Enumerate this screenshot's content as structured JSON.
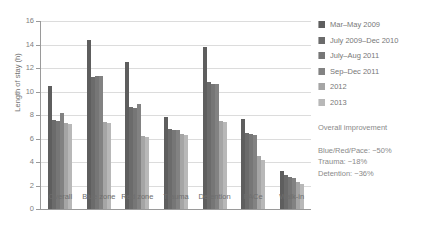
{
  "chart_data": {
    "type": "bar",
    "title": "",
    "xlabel": "",
    "ylabel": "Length of stay (h)",
    "ylim": [
      0,
      16
    ],
    "yticks": [
      0,
      2,
      4,
      6,
      8,
      10,
      12,
      14,
      16
    ],
    "grid": true,
    "legend_position": "right",
    "categories": [
      "Overall",
      "Blue zone",
      "Red zone",
      "Trauma",
      "Detention",
      "PACe",
      "Walk-in"
    ],
    "series": [
      {
        "name": "Mar–May 2009",
        "color": "#5e5e5e",
        "values": [
          10.5,
          14.4,
          12.5,
          7.8,
          13.8,
          7.7,
          3.2
        ]
      },
      {
        "name": "July  2009–Dec 2010",
        "color": "#6b6b6b",
        "values": [
          7.6,
          11.2,
          8.7,
          6.8,
          10.8,
          6.5,
          2.9
        ]
      },
      {
        "name": "July–Aug 2011",
        "color": "#767676",
        "values": [
          7.5,
          11.3,
          8.6,
          6.7,
          10.6,
          6.4,
          2.7
        ]
      },
      {
        "name": "Sep–Dec 2011",
        "color": "#828282",
        "values": [
          8.2,
          11.3,
          8.9,
          6.7,
          10.6,
          6.3,
          2.6
        ]
      },
      {
        "name": "2012",
        "color": "#a5a5a5",
        "values": [
          7.3,
          7.4,
          6.2,
          6.4,
          7.5,
          4.5,
          2.3
        ]
      },
      {
        "name": "2013",
        "color": "#b8b8b8",
        "values": [
          7.2,
          7.3,
          6.1,
          6.3,
          7.4,
          4.2,
          2.1
        ]
      }
    ],
    "annotations": {
      "heading": "Overall improvement",
      "lines": [
        "Blue/Red/Pace: −50%",
        "Trauma: −18%",
        "Detention: −36%"
      ]
    }
  }
}
